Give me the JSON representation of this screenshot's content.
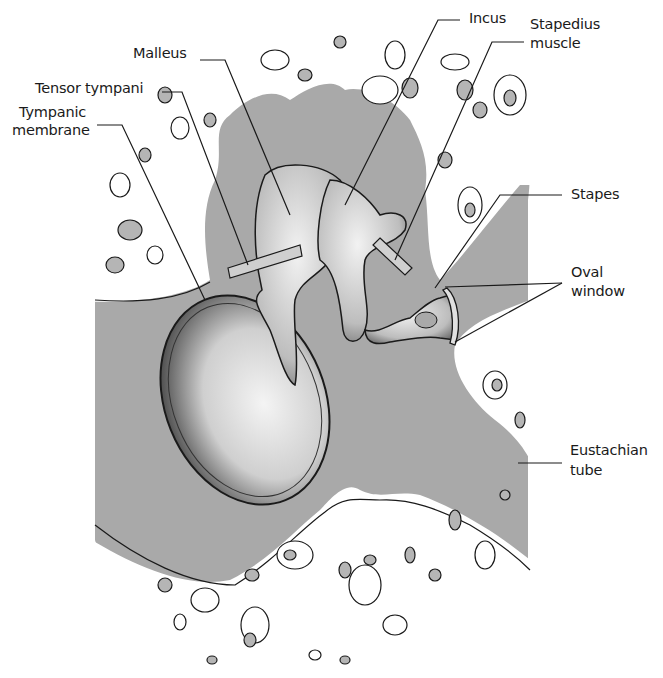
{
  "figure": {
    "colors": {
      "cavity_gray": "#a9a9a9",
      "bone_white": "#ffffff",
      "ink": "#1a1a1a",
      "cell_gray": "#b5b5b5"
    }
  },
  "labels": {
    "malleus": "Malleus",
    "tensor_tympani": "Tensor tympani",
    "tympanic_membrane_1": "Tympanic",
    "tympanic_membrane_2": "membrane",
    "incus": "Incus",
    "stapedius_1": "Stapedius",
    "stapedius_2": "muscle",
    "stapes": "Stapes",
    "oval_window_1": "Oval",
    "oval_window_2": "window",
    "eustachian_1": "Eustachian",
    "eustachian_2": "tube"
  }
}
